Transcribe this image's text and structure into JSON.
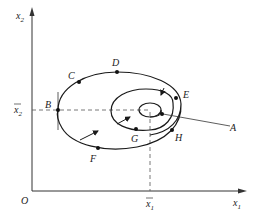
{
  "diagram": {
    "type": "phase-plane spiral trajectory",
    "axes": {
      "x_label": "x",
      "x_label_sub": "1",
      "y_label": "x",
      "y_label_sub": "2",
      "origin_label": "O",
      "x_bar_label": "x",
      "x_bar_sub": "1",
      "y_bar_label": "x",
      "y_bar_sub": "2"
    },
    "points": [
      {
        "label": "A"
      },
      {
        "label": "B"
      },
      {
        "label": "C"
      },
      {
        "label": "D"
      },
      {
        "label": "E"
      },
      {
        "label": "F"
      },
      {
        "label": "G"
      },
      {
        "label": "H"
      }
    ],
    "colors": {
      "line": "#1a1a1a",
      "axis": "#333333",
      "dash": "#555555",
      "background": "#ffffff"
    }
  }
}
